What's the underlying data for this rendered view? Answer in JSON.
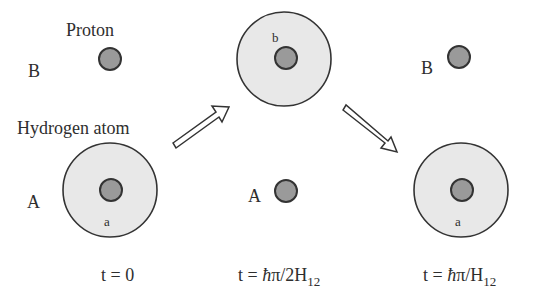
{
  "diagram": {
    "labels": {
      "proton": "Proton",
      "hydrogen_atom": "Hydrogen atom"
    },
    "colors": {
      "electron_cloud": "#e8e8e8",
      "proton_fill": "#9a9a9a",
      "outline": "#333333",
      "arrow_fill": "#ffffff"
    },
    "panels": [
      {
        "id": "t0",
        "site_B_label": "B",
        "site_A_label": "A",
        "orbital_label": "a",
        "time_label": "t = 0"
      },
      {
        "id": "t_half",
        "site_A_label": "A",
        "orbital_label": "b",
        "time_prefix": "t = ",
        "time_hbar": "ħ",
        "time_mid": "π/2H",
        "time_sub": "12"
      },
      {
        "id": "t_full",
        "site_B_label": "B",
        "orbital_label": "a",
        "time_prefix": "t = ",
        "time_hbar": "ħ",
        "time_mid": "π/H",
        "time_sub": "12"
      }
    ]
  }
}
